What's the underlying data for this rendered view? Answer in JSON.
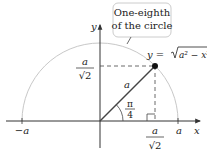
{
  "diagram": {
    "callout": {
      "line1": "One-eighth",
      "line2": "of the circle"
    },
    "equation": {
      "lhs": "y = ",
      "radicand": "a² − x²"
    },
    "axes": {
      "x_label": "x",
      "y_label": "y",
      "neg_a": "−a",
      "pos_a": "a"
    },
    "y_coord_label": {
      "num": "a",
      "den": "√2"
    },
    "x_coord_label": {
      "num": "a",
      "den": "√2"
    },
    "radius_label": "a",
    "angle_label": {
      "num": "π",
      "den": "4"
    },
    "colors": {
      "circle": "#c8c8c8",
      "axis": "#333333",
      "radius": "#444444",
      "point": "#111111",
      "callout_border": "#cccccc"
    }
  }
}
